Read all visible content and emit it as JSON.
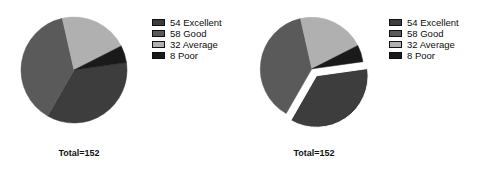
{
  "figure": {
    "title": "",
    "panels": [
      {
        "name": "pie-standard",
        "caption": "Total=152",
        "exploded_slice": null
      },
      {
        "name": "pie-exploded",
        "caption": "Total=152",
        "exploded_slice": "Excellent"
      }
    ]
  },
  "legend": {
    "items": [
      {
        "label": "54 Excellent",
        "value": 54,
        "category": "Excellent",
        "color": "#3d3d3d"
      },
      {
        "label": "58 Good",
        "value": 58,
        "category": "Good",
        "color": "#5a5a5a"
      },
      {
        "label": "32 Average",
        "value": 32,
        "category": "Average",
        "color": "#b0b0b0"
      },
      {
        "label": "8 Poor",
        "value": 8,
        "category": "Poor",
        "color": "#1a1a1a"
      }
    ]
  },
  "chart_data": {
    "type": "pie",
    "title": "",
    "categories": [
      "Excellent",
      "Good",
      "Average",
      "Poor"
    ],
    "values": [
      54,
      58,
      32,
      8
    ],
    "total": 152,
    "total_label": "Total=152",
    "legend_labels": [
      "54 Excellent",
      "58 Good",
      "32 Average",
      "8 Poor"
    ],
    "colors": [
      "#3d3d3d",
      "#5a5a5a",
      "#b0b0b0",
      "#1a1a1a"
    ],
    "legend_position": "right",
    "grid": false,
    "charts": [
      {
        "id": "left",
        "caption": "Total=152",
        "explode": [
          0,
          0,
          0,
          0
        ],
        "start_angle_deg": -8,
        "values": [
          54,
          58,
          32,
          8
        ]
      },
      {
        "id": "right",
        "caption": "Total=152",
        "explode": [
          0.16,
          0,
          0,
          0
        ],
        "start_angle_deg": -8,
        "values": [
          54,
          58,
          32,
          8
        ]
      }
    ]
  }
}
